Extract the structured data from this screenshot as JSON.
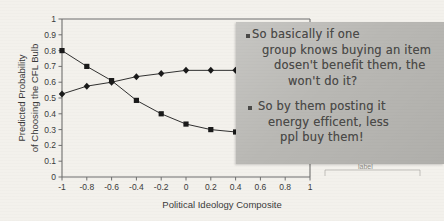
{
  "figure": {
    "background_color": "#f3f1ec",
    "axis_color": "#6e6e6e",
    "series_color": "#1a1a1a"
  },
  "chart_data": {
    "type": "line",
    "title": "",
    "xlabel": "Political Ideology Composite",
    "ylabel": "Predicted Probability of Choosing the CFL Bulb",
    "ylabel_line1": "Predicted Probability",
    "ylabel_line2": "of Choosing the CFL Bulb",
    "xlim": [
      -1,
      1
    ],
    "ylim": [
      0,
      1
    ],
    "xticks": [
      -1,
      -0.8,
      -0.6,
      -0.4,
      -0.2,
      0,
      0.2,
      0.4,
      0.6,
      0.8,
      1
    ],
    "xtick_labels": [
      "-1",
      "-0.8",
      "-0.6",
      "-0.4",
      "-0.2",
      "0",
      "0.2",
      "0.4",
      "0.6",
      "0.8",
      "1"
    ],
    "yticks": [
      0,
      0.1,
      0.2,
      0.3,
      0.4,
      0.5,
      0.6,
      0.7,
      0.8,
      0.9,
      1
    ],
    "ytick_labels": [
      "0",
      "0.1",
      "0.2",
      "0.3",
      "0.4",
      "0.5",
      "0.6",
      "0.7",
      "0.8",
      "0.9",
      "1"
    ],
    "grid": false,
    "legend": "none",
    "x": [
      -1,
      -0.8,
      -0.6,
      -0.4,
      -0.2,
      0,
      0.2,
      0.4
    ],
    "series": [
      {
        "name": "declining-series",
        "marker": "square",
        "values": [
          0.8,
          0.7,
          0.61,
          0.485,
          0.4,
          0.335,
          0.3,
          0.285
        ]
      },
      {
        "name": "rising-series",
        "marker": "diamond",
        "values": [
          0.525,
          0.575,
          0.6,
          0.635,
          0.655,
          0.675,
          0.675,
          0.675
        ]
      }
    ]
  },
  "sticky_note": {
    "background_color": "#b9b8b4",
    "ink_color": "#4b4a48",
    "bullets": [
      {
        "lines": [
          "So basically if one",
          "group knows buying an item",
          "dosen't benefit them, the",
          "won't do it?"
        ]
      },
      {
        "lines": [
          "So by them posting it",
          "energy efficent, less",
          "ppl buy them!"
        ]
      }
    ]
  },
  "hidden_label": {
    "text": "label"
  }
}
